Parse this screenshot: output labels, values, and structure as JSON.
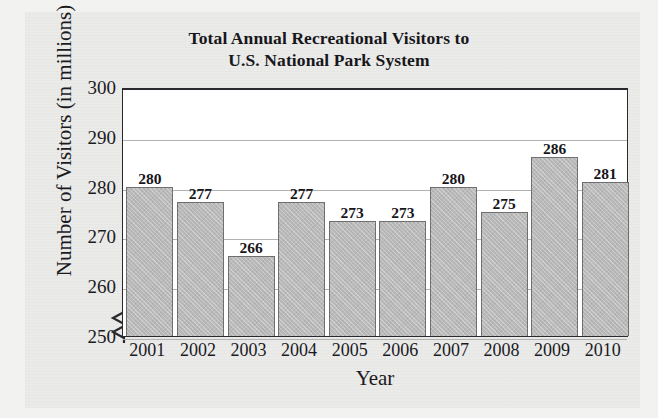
{
  "chart_data": {
    "type": "bar",
    "title": "Total Annual Recreational Visitors to U.S. National Park System",
    "title_lines": [
      "Total Annual Recreational Visitors to",
      "U.S. National Park System"
    ],
    "xlabel": "Year",
    "ylabel": "Number of Visitors (in millions)",
    "categories": [
      "2001",
      "2002",
      "2003",
      "2004",
      "2005",
      "2006",
      "2007",
      "2008",
      "2009",
      "2010"
    ],
    "values": [
      280,
      277,
      266,
      277,
      273,
      273,
      280,
      275,
      286,
      281
    ],
    "data_labels": [
      "280",
      "277",
      "266",
      "277",
      "273",
      "273",
      "280",
      "275",
      "286",
      "281"
    ],
    "ylim": [
      250,
      300
    ],
    "yticks": [
      300,
      290,
      280,
      270,
      260,
      250
    ],
    "ytick_labels": [
      "300",
      "290",
      "280",
      "270",
      "260",
      "250"
    ],
    "grid": "horizontal",
    "axis_break": "y-axis broken below 250",
    "legend": "none",
    "bar_color": "#b9b9b9",
    "bar_edge_color": "#6f6f70",
    "plot_background": "#ffffff",
    "page_background": "#ebebea",
    "text_color": "#17161a"
  }
}
